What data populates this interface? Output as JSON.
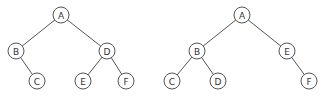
{
  "diagram": {
    "type": "binary-trees",
    "colors": {
      "stroke": "#555555",
      "text": "#333333",
      "fill": "#ffffff",
      "background": "#ffffff"
    },
    "node_radius": 8,
    "trees": [
      {
        "id": "tree-1",
        "nodes": [
          {
            "id": "A",
            "label": "A",
            "x": 61,
            "y": 15
          },
          {
            "id": "B",
            "label": "B",
            "x": 16,
            "y": 51
          },
          {
            "id": "C",
            "label": "C",
            "x": 37,
            "y": 81
          },
          {
            "id": "D",
            "label": "D",
            "x": 107,
            "y": 51
          },
          {
            "id": "E",
            "label": "E",
            "x": 83,
            "y": 81
          },
          {
            "id": "F",
            "label": "F",
            "x": 126,
            "y": 81
          }
        ],
        "edges": [
          [
            "A",
            "B"
          ],
          [
            "A",
            "D"
          ],
          [
            "B",
            "C"
          ],
          [
            "D",
            "E"
          ],
          [
            "D",
            "F"
          ]
        ]
      },
      {
        "id": "tree-2",
        "nodes": [
          {
            "id": "A",
            "label": "A",
            "x": 242,
            "y": 15
          },
          {
            "id": "B",
            "label": "B",
            "x": 197,
            "y": 51
          },
          {
            "id": "C",
            "label": "C",
            "x": 172,
            "y": 81
          },
          {
            "id": "D",
            "label": "D",
            "x": 218,
            "y": 81
          },
          {
            "id": "E",
            "label": "E",
            "x": 287,
            "y": 51
          },
          {
            "id": "F",
            "label": "F",
            "x": 309,
            "y": 81
          }
        ],
        "edges": [
          [
            "A",
            "B"
          ],
          [
            "A",
            "E"
          ],
          [
            "B",
            "C"
          ],
          [
            "B",
            "D"
          ],
          [
            "E",
            "F"
          ]
        ]
      }
    ]
  }
}
